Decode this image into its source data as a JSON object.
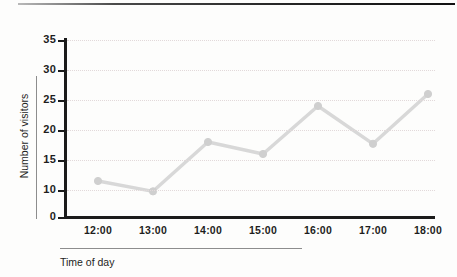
{
  "chart_data": {
    "type": "line",
    "title": "",
    "xlabel": "Time of day",
    "ylabel": "Number of visitors",
    "categories": [
      "12:00",
      "13:00",
      "14:00",
      "15:00",
      "16:00",
      "17:00",
      "18:00"
    ],
    "values": [
      11.5,
      9.5,
      18,
      16,
      24,
      17.7,
      26
    ],
    "series": [
      {
        "name": "Number of visitors",
        "values": [
          11.5,
          9.5,
          18,
          16,
          24,
          17.7,
          26
        ]
      }
    ],
    "y_ticks": [
      0,
      10,
      15,
      20,
      25,
      30,
      35
    ],
    "ylim": [
      0,
      35
    ],
    "broken_axis": true,
    "grid": true,
    "grid_axis": "y",
    "legend": "none",
    "marker": "circle",
    "line_color": "#d8d8d8",
    "marker_color": "#cfcfcf",
    "grid_color": "#e2d9da",
    "axis_color": "#1b1b1b",
    "text_color": "#1d1d1d"
  },
  "axes": {
    "y_title": "Number of visitors",
    "x_title": "Time of day",
    "y_tick_labels": [
      "35",
      "30",
      "25",
      "20",
      "15",
      "10",
      "0"
    ],
    "x_tick_labels": [
      "12:00",
      "13:00",
      "14:00",
      "15:00",
      "16:00",
      "17:00",
      "18:00"
    ]
  }
}
